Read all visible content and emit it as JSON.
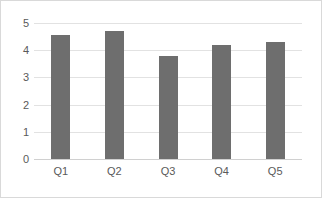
{
  "chart_data": {
    "type": "bar",
    "title": "",
    "subtitle": "",
    "xlabel": "",
    "ylabel": "",
    "categories": [
      "Q1",
      "Q2",
      "Q3",
      "Q4",
      "Q5"
    ],
    "values": [
      4.55,
      4.7,
      3.8,
      4.2,
      4.3
    ],
    "series": [
      {
        "name": "Series 1",
        "values": [
          4.55,
          4.7,
          3.8,
          4.2,
          4.3
        ]
      }
    ],
    "ylim": [
      0,
      5
    ],
    "yticks": [
      0,
      1,
      2,
      3,
      4,
      5
    ],
    "ytick_labels": [
      "0",
      "1",
      "2",
      "3",
      "4",
      "5"
    ],
    "xtick_labels": [
      "Q1",
      "Q2",
      "Q3",
      "Q4",
      "Q5"
    ],
    "grid": true,
    "grid_axis": "y",
    "legend": false,
    "legend_position": "none",
    "annotations": [],
    "colors": {
      "bar": "#6e6e6e",
      "gridline": "#e2e2e2",
      "baseline": "#d0d0d0",
      "tick_text": "#5a5a5a",
      "plot_background": "#ffffff",
      "frame_border": "#d9d9d9"
    }
  },
  "axis": {
    "y_labels": [
      "5",
      "4",
      "3",
      "2",
      "1",
      "0"
    ]
  }
}
